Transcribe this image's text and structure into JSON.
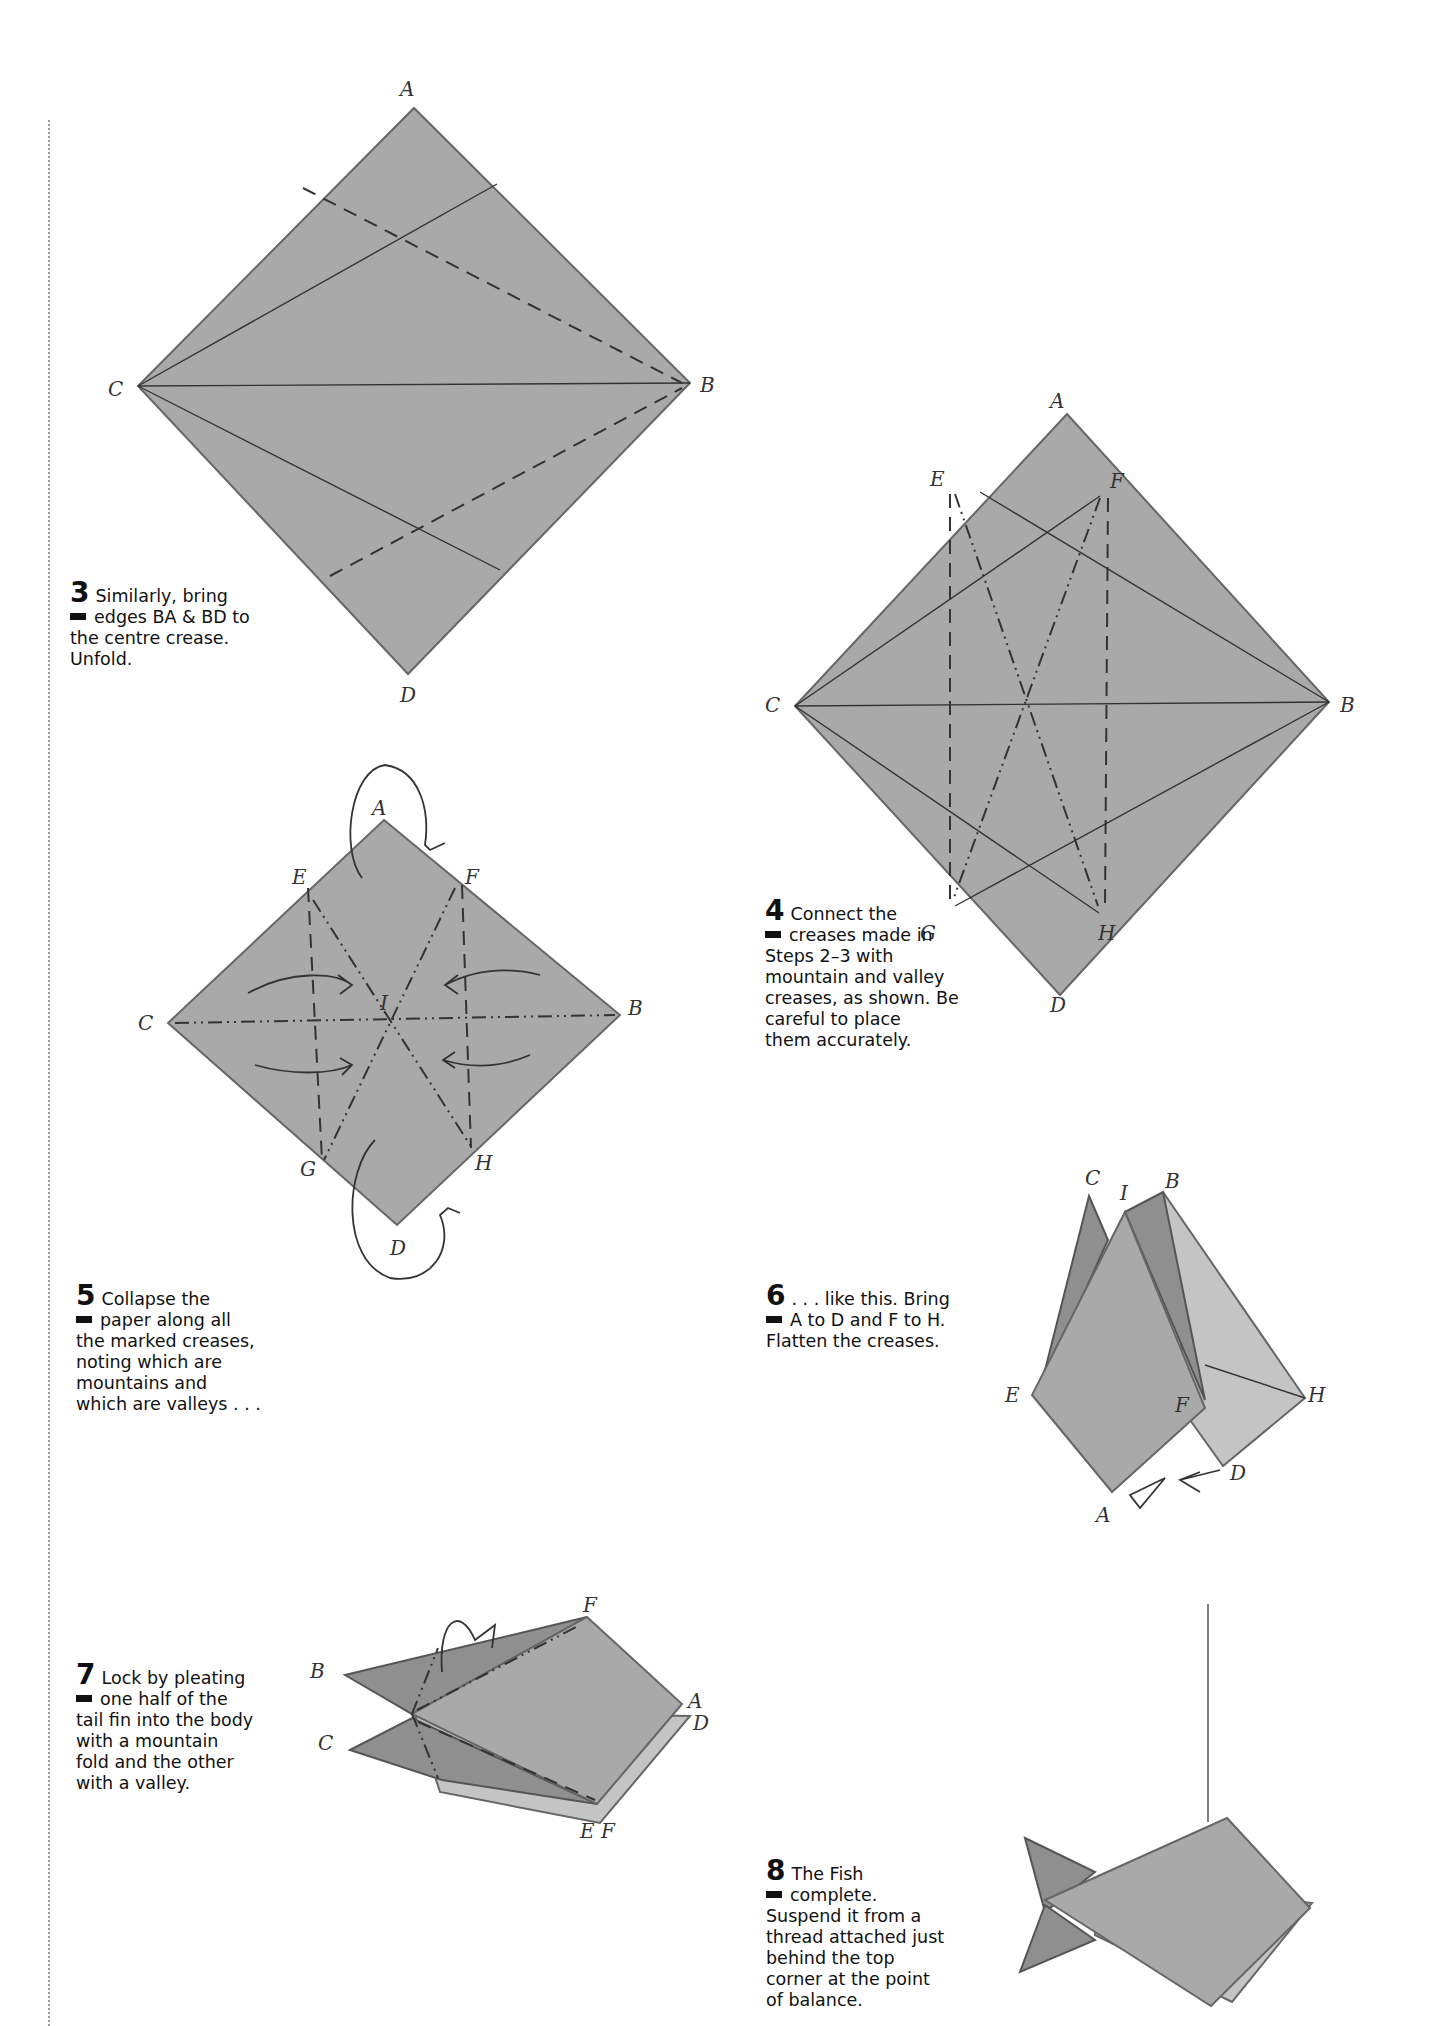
{
  "page": {
    "background": "#ffffff",
    "paper_color": "#a9a9a9",
    "text_color": "#111111"
  },
  "steps": [
    {
      "number": "3",
      "lines": [
        "Similarly, bring",
        "edges BA & BD to",
        "the centre crease.",
        "Unfold."
      ],
      "diagram": {
        "labels": {
          "A": "A",
          "B": "B",
          "C": "C",
          "D": "D"
        },
        "creases": [
          "C-B solid",
          "C to upper edge solid",
          "C to lower edge solid",
          "valley fold BA",
          "valley fold BD"
        ]
      }
    },
    {
      "number": "4",
      "lines": [
        "Connect the",
        "creases made in",
        "Steps 2–3 with",
        "mountain and valley",
        "creases, as shown. Be",
        "careful to place",
        "them accurately."
      ],
      "diagram": {
        "labels": {
          "A": "A",
          "B": "B",
          "C": "C",
          "D": "D",
          "E": "E",
          "F": "F",
          "G": "G",
          "H": "H"
        }
      }
    },
    {
      "number": "5",
      "lines": [
        "Collapse the",
        "paper along all",
        "the marked creases,",
        "noting which are",
        "mountains and",
        "which are valleys . . ."
      ],
      "diagram": {
        "labels": {
          "A": "A",
          "B": "B",
          "C": "C",
          "D": "D",
          "E": "E",
          "F": "F",
          "G": "G",
          "H": "H",
          "I": "I"
        }
      }
    },
    {
      "number": "6",
      "lines": [
        ". . . like this. Bring",
        "A to D and F to H.",
        "Flatten the creases."
      ],
      "diagram": {
        "labels": {
          "A": "A",
          "B": "B",
          "C": "C",
          "D": "D",
          "E": "E",
          "F": "F",
          "H": "H",
          "I": "I"
        }
      }
    },
    {
      "number": "7",
      "lines": [
        "Lock by pleating",
        "one half of the",
        "tail fin into the body",
        "with a mountain",
        "fold and the other",
        "with a valley."
      ],
      "diagram": {
        "labels": {
          "A": "A",
          "B": "B",
          "C": "C",
          "D": "D",
          "F": "F",
          "EF": "E F"
        }
      }
    },
    {
      "number": "8",
      "lines": [
        "The Fish",
        "complete.",
        "Suspend it from a",
        "thread attached just",
        "behind the top",
        "corner at the point",
        "of balance."
      ],
      "diagram": {
        "subject": "completed origami fish hanging on thread"
      }
    }
  ]
}
